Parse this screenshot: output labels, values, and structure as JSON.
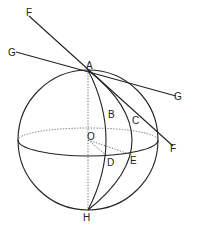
{
  "diagram": {
    "labels": {
      "F_top": "F",
      "G_left": "G",
      "A": "A",
      "G_right": "G",
      "B": "B",
      "C": "C",
      "O": "O",
      "D": "D",
      "E": "E",
      "F_bottom": "F",
      "H": "H"
    },
    "line_color": "#222222"
  }
}
